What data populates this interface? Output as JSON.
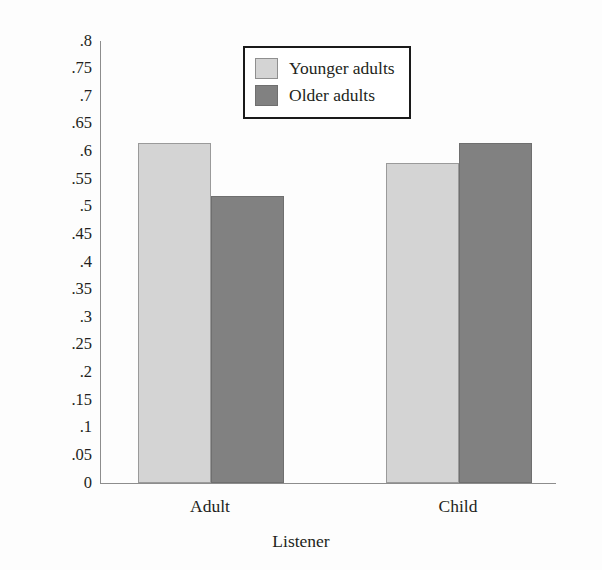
{
  "chart_data": {
    "type": "bar",
    "title": "",
    "xlabel": "Listener",
    "ylabel": "Mean proportion propositions recalled",
    "categories": [
      "Adult",
      "Child"
    ],
    "series": [
      {
        "name": "Younger adults",
        "values": [
          0.615,
          0.58
        ],
        "color": "#d4d4d4"
      },
      {
        "name": "Older adults",
        "values": [
          0.52,
          0.615
        ],
        "color": "#818181"
      }
    ],
    "ylim": [
      0,
      0.8
    ],
    "ytick_values": [
      0,
      0.05,
      0.1,
      0.15,
      0.2,
      0.25,
      0.3,
      0.35,
      0.4,
      0.45,
      0.5,
      0.55,
      0.6,
      0.65,
      0.7,
      0.75,
      0.8
    ],
    "ytick_labels": [
      "0",
      ".05",
      ".1",
      ".15",
      ".2",
      ".25",
      ".3",
      ".35",
      ".4",
      ".45",
      ".5",
      ".55",
      ".6",
      ".65",
      ".7",
      ".75",
      ".8"
    ],
    "grid": false,
    "legend_position": "top-center",
    "legend_entries": [
      "Younger adults",
      "Older adults"
    ]
  },
  "legend": {
    "entries": [
      {
        "label": "Younger adults",
        "swatch": "light"
      },
      {
        "label": "Older adults",
        "swatch": "dark"
      }
    ]
  },
  "axes": {
    "x_title": "Listener",
    "y_title": "Mean proportion propositions recalled",
    "x_categories": [
      "Adult",
      "Child"
    ]
  }
}
